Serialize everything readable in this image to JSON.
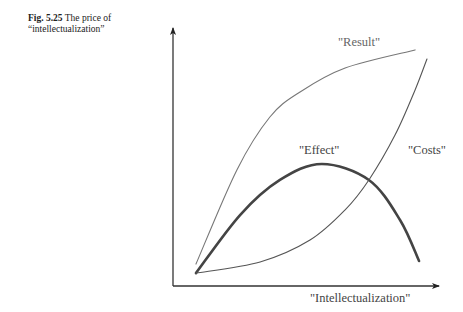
{
  "caption": {
    "figure_number": "Fig. 5.25",
    "text": "The price of",
    "text_line2": "“intellectualization”"
  },
  "chart_data": {
    "type": "line",
    "title": "The price of “intellectualization”",
    "xlabel": "\"Intellectualization\"",
    "ylabel": "",
    "xlim": [
      0,
      1
    ],
    "ylim": [
      0,
      1
    ],
    "grid": false,
    "ticks": false,
    "note": "Conceptual curves; normalized units (no numeric axis scale shown)",
    "series": [
      {
        "name": "\"Result\"",
        "color": "#777777",
        "weight": "thin",
        "points": [
          [
            0.087,
            0.085
          ],
          [
            0.242,
            0.45
          ],
          [
            0.367,
            0.655
          ],
          [
            0.481,
            0.752
          ],
          [
            0.652,
            0.845
          ],
          [
            0.917,
            0.915
          ]
        ]
      },
      {
        "name": "\"Effect\"",
        "color": "#444444",
        "weight": "thick",
        "points": [
          [
            0.087,
            0.05
          ],
          [
            0.254,
            0.275
          ],
          [
            0.405,
            0.411
          ],
          [
            0.564,
            0.473
          ],
          [
            0.742,
            0.411
          ],
          [
            0.86,
            0.256
          ],
          [
            0.932,
            0.097
          ]
        ]
      },
      {
        "name": "\"Costs\"",
        "color": "#555555",
        "weight": "thin",
        "points": [
          [
            0.087,
            0.05
          ],
          [
            0.33,
            0.093
          ],
          [
            0.519,
            0.178
          ],
          [
            0.652,
            0.295
          ],
          [
            0.742,
            0.411
          ],
          [
            0.841,
            0.585
          ],
          [
            0.917,
            0.76
          ],
          [
            0.962,
            0.88
          ]
        ]
      }
    ],
    "annotations": [
      {
        "text": "\"Result\"",
        "series": "\"Result\"",
        "at": [
          0.625,
          0.93
        ]
      },
      {
        "text": "\"Effect\"",
        "series": "\"Effect\"",
        "at": [
          0.477,
          0.51
        ]
      },
      {
        "text": "\"Costs\"",
        "series": "\"Costs\"",
        "at": [
          0.89,
          0.51
        ]
      }
    ]
  }
}
